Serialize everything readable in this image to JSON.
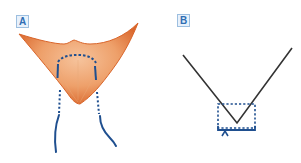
{
  "figure": {
    "panels": [
      {
        "id": "A",
        "label": "A",
        "description": "Orange V-shaped tissue flap with dashed incision arc and dotted/solid blue lines extending downward"
      },
      {
        "id": "B",
        "label": "B",
        "description": "Black V-shaped line with dashed blue rectangle around the vertex and a bracket with upward arrow below"
      }
    ],
    "colors": {
      "tissue_fill": "#e8874a",
      "tissue_edge": "#d9652a",
      "tissue_highlight": "#f6c39c",
      "marking_blue": "#1f4f8f",
      "line_black": "#333333",
      "label_blue": "#2f6db3",
      "label_bg": "#e8f1fb"
    }
  }
}
